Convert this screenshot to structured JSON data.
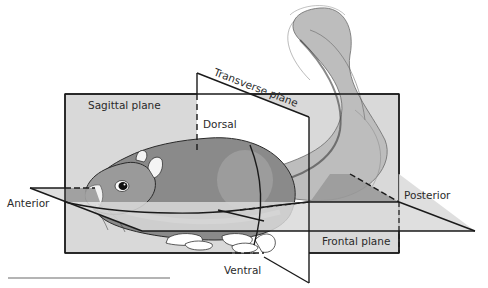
{
  "planes": {
    "sagittal": "Sagittal plane",
    "transverse": "Transverse plane",
    "frontal": "Frontal plane"
  },
  "directions": {
    "dorsal": "Dorsal",
    "ventral": "Ventral",
    "anterior": "Anterior",
    "posterior": "Posterior"
  },
  "colors": {
    "plane_fill": "#d9d9d9",
    "plane_dark_fill": "#9a9a9a",
    "line": "#1a1a1a",
    "background": "#ffffff",
    "text": "#2a2a2a"
  }
}
